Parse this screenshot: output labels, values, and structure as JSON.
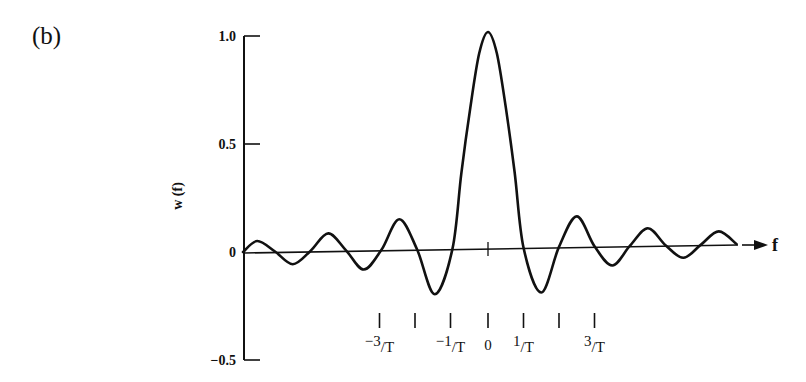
{
  "panel_label": "(b)",
  "chart_data": {
    "type": "line",
    "title": "",
    "xlabel": "f",
    "ylabel": "w (f)",
    "ylim": [
      -0.5,
      1.0
    ],
    "yticks": [
      {
        "value": 1.0,
        "label": "1.0"
      },
      {
        "value": 0.5,
        "label": "0.5"
      },
      {
        "value": 0,
        "label": "0"
      },
      {
        "value": -0.5,
        "label": "-0.5"
      }
    ],
    "xticks": [
      {
        "value": -3,
        "label_num": "-3",
        "label_den": "T"
      },
      {
        "value": -2,
        "label_num": "",
        "label_den": ""
      },
      {
        "value": -1,
        "label_num": "-1",
        "label_den": "T"
      },
      {
        "value": 0,
        "label_num": "0",
        "label_den": ""
      },
      {
        "value": 1,
        "label_num": "1",
        "label_den": "T"
      },
      {
        "value": 2,
        "label_num": "",
        "label_den": ""
      },
      {
        "value": 3,
        "label_num": "3",
        "label_den": "T"
      }
    ],
    "x_units": "1/T",
    "grid": false,
    "legend": null,
    "series": [
      {
        "name": "w(f)",
        "x": [
          -6.9,
          -6.5,
          -6.0,
          -5.5,
          -5.0,
          -4.5,
          -4.0,
          -3.5,
          -3.0,
          -2.5,
          -2.0,
          -1.5,
          -1.0,
          -0.75,
          -0.5,
          -0.25,
          0.0,
          0.25,
          0.5,
          0.75,
          1.0,
          1.5,
          2.0,
          2.5,
          3.0,
          3.5,
          4.0,
          4.5,
          5.0,
          5.5,
          6.0,
          6.5,
          7.0
        ],
        "values": [
          0.0,
          0.05,
          0.0,
          -0.06,
          0.0,
          0.08,
          0.0,
          -0.09,
          0.0,
          0.14,
          0.0,
          -0.21,
          0.0,
          0.35,
          0.65,
          0.9,
          1.0,
          0.9,
          0.65,
          0.35,
          0.0,
          -0.21,
          0.0,
          0.14,
          0.0,
          -0.09,
          0.0,
          0.08,
          0.0,
          -0.06,
          0.0,
          0.06,
          0.0
        ]
      }
    ]
  }
}
